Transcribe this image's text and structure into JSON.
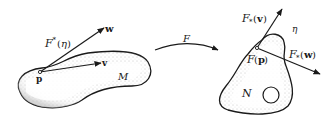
{
  "diagram": {
    "type": "manifold-map-illustration",
    "left_manifold": {
      "name": "M",
      "point_label": "p",
      "vectors": [
        {
          "label": "w"
        },
        {
          "label": "v"
        }
      ],
      "covector_label": "F*(η)"
    },
    "map": {
      "label": "F"
    },
    "right_manifold": {
      "name": "N",
      "point_label": "F(p)",
      "covector_label": "η",
      "pushforward_vectors": [
        {
          "label": "F*(v)",
          "label_main": "F",
          "label_sub": "*",
          "label_arg": "(v)"
        },
        {
          "label": "F*(w)",
          "label_main": "F",
          "label_sub": "*",
          "label_arg": "(w)"
        }
      ]
    },
    "colors": {
      "ink": "#1a1a1a",
      "stipple": "#8a8a8a",
      "background": "#ffffff"
    }
  }
}
